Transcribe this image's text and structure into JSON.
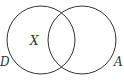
{
  "diagram": {
    "type": "venn",
    "sets": [
      {
        "name": "D",
        "label": "D",
        "cx": 41,
        "cy": 40,
        "r": 34
      },
      {
        "name": "A",
        "label": "A",
        "cx": 82,
        "cy": 40,
        "r": 34
      }
    ],
    "region_label": {
      "text": "X",
      "region": "D only"
    },
    "stroke_color": "#333333"
  }
}
